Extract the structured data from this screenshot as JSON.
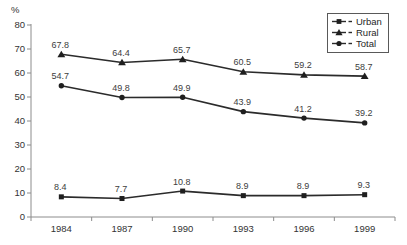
{
  "chart_data": {
    "type": "line",
    "title": "",
    "xlabel": "",
    "ylabel": "%",
    "categories": [
      "1984",
      "1987",
      "1990",
      "1993",
      "1996",
      "1999"
    ],
    "series": [
      {
        "name": "Urban",
        "marker": "square",
        "values": [
          8.4,
          7.7,
          10.8,
          8.9,
          8.9,
          9.3
        ]
      },
      {
        "name": "Rural",
        "marker": "triangle",
        "values": [
          67.8,
          64.4,
          65.7,
          60.5,
          59.2,
          58.7
        ]
      },
      {
        "name": "Total",
        "marker": "circle",
        "values": [
          54.7,
          49.8,
          49.9,
          43.9,
          41.2,
          39.2
        ]
      }
    ],
    "ylim": [
      0,
      80
    ],
    "ytick_step": 10,
    "yticks": [
      0,
      10,
      20,
      30,
      40,
      50,
      60,
      70,
      80
    ],
    "grid": false,
    "legend_position": "top-right",
    "data_labels": true,
    "colors": {
      "line": "#2b2b2b",
      "marker": "#1f1f1f",
      "axis": "#8c8c8c",
      "tick_text": "#333333",
      "data_label_text": "#3d3d3d",
      "background": "#ffffff",
      "legend_border": "#595959"
    }
  }
}
